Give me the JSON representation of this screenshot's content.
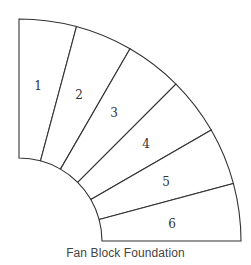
{
  "diagram": {
    "title": "Fan Block Foundation",
    "shape": "quarter-annulus fan",
    "center": [
      19,
      241
    ],
    "inner_radius": 83,
    "outer_radius": 222,
    "stroke_color": "#333333",
    "blocks": [
      {
        "number": "1",
        "start_angle": 75,
        "end_angle": 90,
        "label_pos": [
          38,
          90
        ]
      },
      {
        "number": "2",
        "start_angle": 60,
        "end_angle": 75,
        "label_pos": [
          79,
          99
        ]
      },
      {
        "number": "3",
        "start_angle": 45,
        "end_angle": 60,
        "label_pos": [
          114,
          117
        ]
      },
      {
        "number": "4",
        "start_angle": 30,
        "end_angle": 45,
        "label_pos": [
          146,
          148
        ]
      },
      {
        "number": "5",
        "start_angle": 15,
        "end_angle": 30,
        "label_pos": [
          166,
          186
        ]
      },
      {
        "number": "6",
        "start_angle": 0,
        "end_angle": 15,
        "label_pos": [
          172,
          228
        ]
      }
    ]
  }
}
